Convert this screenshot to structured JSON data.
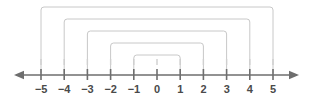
{
  "figure": {
    "type": "number-line-diagram",
    "title": "",
    "axis": {
      "min": -5,
      "max": 5,
      "left_arrow": true,
      "right_arrow": true,
      "line_color": "#6e6e6e",
      "tick_color": "#6e6e6e",
      "label_color": "#4a4a4a"
    },
    "ticks": [
      {
        "value": -5,
        "label": "−5"
      },
      {
        "value": -4,
        "label": "−4"
      },
      {
        "value": -3,
        "label": "−3"
      },
      {
        "value": -2,
        "label": "−2"
      },
      {
        "value": -1,
        "label": "−1"
      },
      {
        "value": 0,
        "label": "0"
      },
      {
        "value": 1,
        "label": "1"
      },
      {
        "value": 2,
        "label": "2"
      },
      {
        "value": 3,
        "label": "3"
      },
      {
        "value": 4,
        "label": "4"
      },
      {
        "value": 5,
        "label": "5"
      }
    ],
    "brackets": [
      {
        "from": -5,
        "to": 5,
        "level": 5
      },
      {
        "from": -4,
        "to": 4,
        "level": 4
      },
      {
        "from": -3,
        "to": 3,
        "level": 3
      },
      {
        "from": -2,
        "to": 2,
        "level": 2
      },
      {
        "from": -1,
        "to": 1,
        "level": 1
      }
    ],
    "bracket_color": "#c8c8c8"
  },
  "chart_data": {
    "type": "number-line",
    "title": "",
    "xlabel": "",
    "ylabel": "",
    "xlim": [
      -5,
      5
    ],
    "categories": [
      "−5",
      "−4",
      "−3",
      "−2",
      "−1",
      "0",
      "1",
      "2",
      "3",
      "4",
      "5"
    ],
    "values": [
      -5,
      -4,
      -3,
      -2,
      -1,
      0,
      1,
      2,
      3,
      4,
      5
    ],
    "grid": false,
    "legend": "none",
    "annotations": [
      {
        "type": "bracket",
        "from": -5,
        "to": 5,
        "label": ""
      },
      {
        "type": "bracket",
        "from": -4,
        "to": 4,
        "label": ""
      },
      {
        "type": "bracket",
        "from": -3,
        "to": 3,
        "label": ""
      },
      {
        "type": "bracket",
        "from": -2,
        "to": 2,
        "label": ""
      },
      {
        "type": "bracket",
        "from": -1,
        "to": 1,
        "label": ""
      }
    ]
  }
}
